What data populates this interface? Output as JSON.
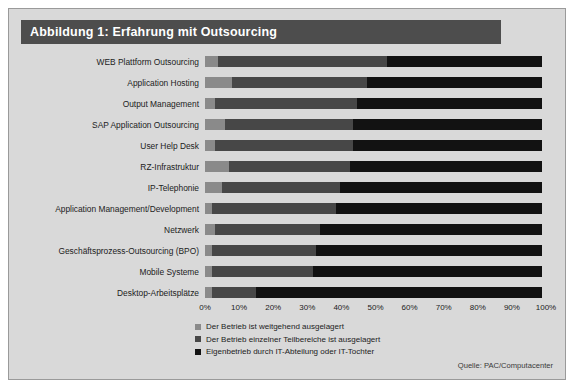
{
  "figure": {
    "title": "Abbildung 1: Erfahrung mit Outsourcing",
    "source": "Quelle: PAC/Computacenter"
  },
  "colors": {
    "series_1": "#8a8a8a",
    "series_2": "#474747",
    "series_3": "#121212",
    "title_bar": "#4d4d4d",
    "panel": "#d9d9d9"
  },
  "chart_data": {
    "type": "bar",
    "orientation": "horizontal",
    "stacked": true,
    "stack_total": 100,
    "title": "Abbildung 1: Erfahrung mit Outsourcing",
    "xlabel": "",
    "ylabel": "",
    "xlim": [
      0,
      100
    ],
    "grid": false,
    "legend_position": "bottom-left",
    "tick_labels": [
      "0%",
      "10%",
      "20%",
      "30%",
      "40%",
      "50%",
      "60%",
      "70%",
      "80%",
      "90%",
      "100%"
    ],
    "tick_values": [
      0,
      10,
      20,
      30,
      40,
      50,
      60,
      70,
      80,
      90,
      100
    ],
    "categories": [
      "WEB Plattform Outsourcing",
      "Application Hosting",
      "Output Management",
      "SAP Application Outsourcing",
      "User Help Desk",
      "RZ-Infrastruktur",
      "IP-Telephonie",
      "Application Management/Development",
      "Netzwerk",
      "Geschäftsprozess-Outsourcing (BPO)",
      "Mobile Systeme",
      "Desktop-Arbeitsplätze"
    ],
    "series": [
      {
        "name": "Der Betrieb ist weitgehend ausgelagert",
        "color": "#8a8a8a",
        "values": [
          4,
          8,
          3,
          6,
          3,
          7,
          5,
          2,
          3,
          2,
          2,
          2
        ]
      },
      {
        "name": "Der Betrieb einzelner Teilbereiche ist ausgelagert",
        "color": "#474747",
        "values": [
          50,
          40,
          42,
          38,
          41,
          36,
          35,
          37,
          31,
          31,
          30,
          13
        ]
      },
      {
        "name": "Eigenbetrieb durch IT-Abteilung oder IT-Tochter",
        "color": "#121212",
        "values": [
          46,
          52,
          55,
          56,
          56,
          57,
          60,
          61,
          66,
          67,
          68,
          85
        ]
      }
    ]
  }
}
